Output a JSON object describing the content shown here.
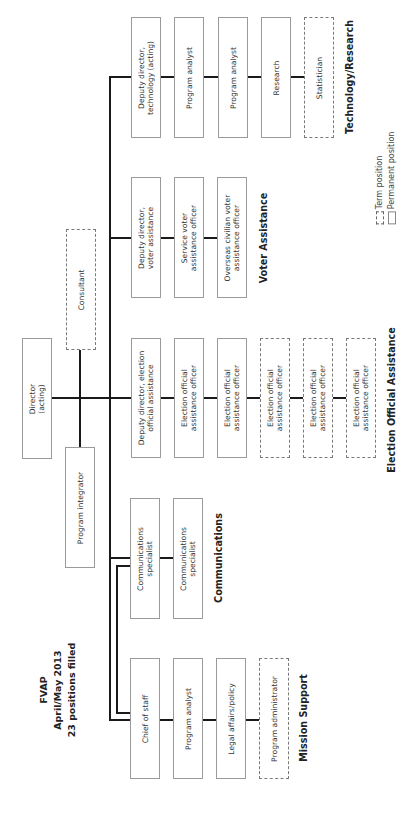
{
  "title": {
    "line1": "FVAP",
    "line2": "April/May 2013",
    "line3": "23 positions filled"
  },
  "top": {
    "director": "Director\n(acting)",
    "consultant": "Consultant",
    "program_integrator": "Program integrator"
  },
  "divisions": {
    "technology_research": {
      "label": "Technology/Research",
      "positions": [
        {
          "title": "Deputy director,\ntechnology (acting)",
          "type": "permanent"
        },
        {
          "title": "Program analyst",
          "type": "permanent"
        },
        {
          "title": "Program analyst",
          "type": "permanent"
        },
        {
          "title": "Research",
          "type": "permanent"
        },
        {
          "title": "Statistician",
          "type": "term"
        }
      ]
    },
    "voter_assistance": {
      "label": "Voter Assistance",
      "positions": [
        {
          "title": "Deputy director,\nvoter assistance",
          "type": "permanent"
        },
        {
          "title": "Service voter\nassistance officer",
          "type": "permanent"
        },
        {
          "title": "Overseas civilian voter\nassistance officer",
          "type": "permanent"
        }
      ]
    },
    "election_official_assistance": {
      "label": "Election Official Assistance",
      "positions": [
        {
          "title": "Deputy director, election\nofficial assistance",
          "type": "permanent"
        },
        {
          "title": "Election official\nassistance officer",
          "type": "permanent"
        },
        {
          "title": "Election official\nassistance officer",
          "type": "permanent"
        },
        {
          "title": "Election official\nassistance officer",
          "type": "term"
        },
        {
          "title": "Election official\nassistance officer",
          "type": "term"
        },
        {
          "title": "Election official\nassistance officer",
          "type": "term"
        }
      ]
    },
    "communications": {
      "label": "Communications",
      "positions": [
        {
          "title": "Communications\nspecialist",
          "type": "permanent"
        },
        {
          "title": "Communications\nspecialist",
          "type": "permanent"
        }
      ]
    },
    "mission_support": {
      "label": "Mission Support",
      "positions": [
        {
          "title": "Chief of staff",
          "type": "permanent"
        },
        {
          "title": "Program analyst",
          "type": "permanent"
        },
        {
          "title": "Legal affairs/policy",
          "type": "permanent"
        },
        {
          "title": "Program administrator",
          "type": "term"
        }
      ]
    }
  },
  "legend": {
    "term": "Term position",
    "permanent": "Permanent position"
  }
}
